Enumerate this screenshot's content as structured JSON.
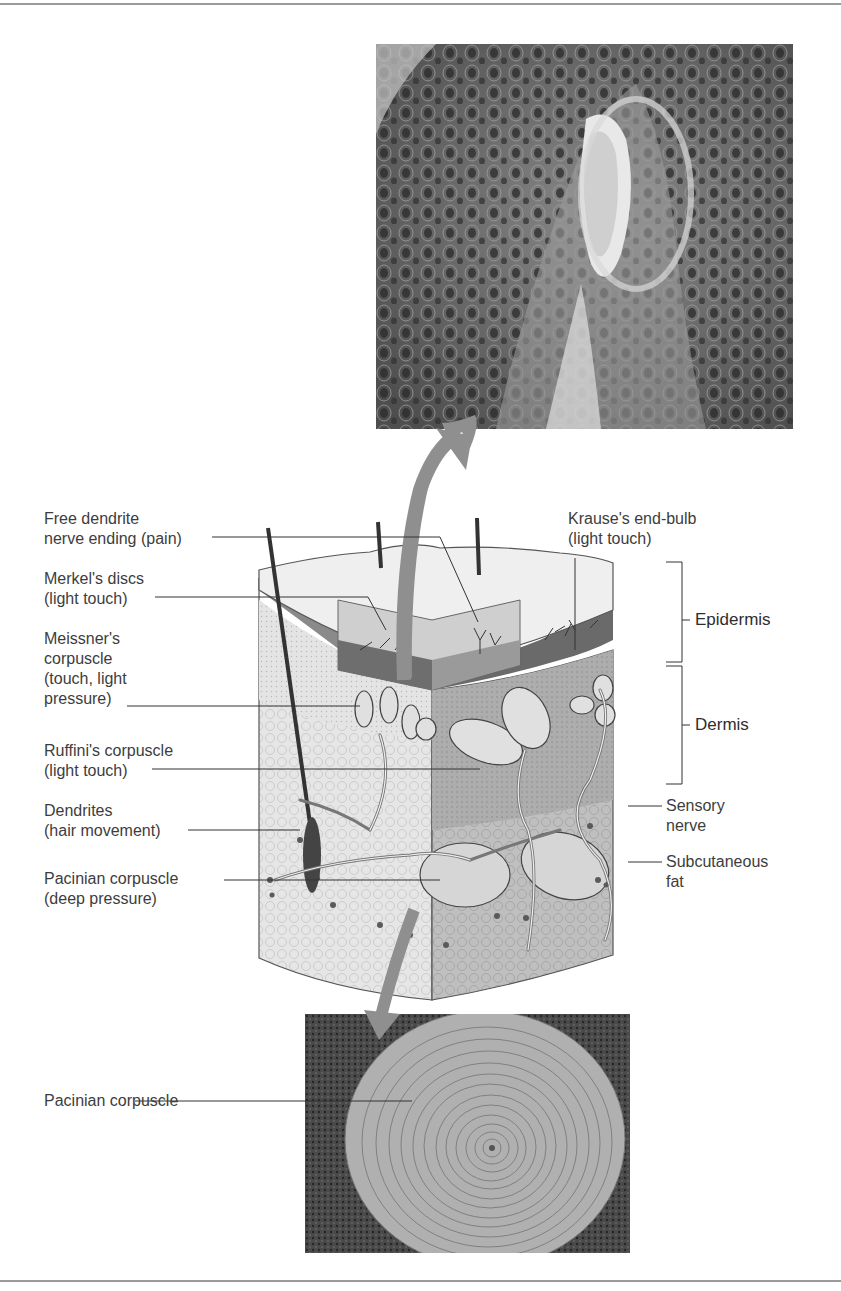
{
  "figure": {
    "micrograph_top": {
      "description": "Light micrograph of Meissner's corpuscle in dermal papilla"
    },
    "micrograph_bottom": {
      "description": "Light micrograph of Pacinian corpuscle cross-section"
    },
    "skin_block": {
      "description": "3D cutaway illustration of skin with sensory receptors"
    }
  },
  "labels_left": [
    {
      "text": "Free dendrite\nnerve ending (pain)"
    },
    {
      "text": "Merkel's discs\n(light touch)"
    },
    {
      "text": "Meissner's\ncorpuscle\n(touch, light\npressure)"
    },
    {
      "text": "Ruffini's corpuscle\n(light touch)"
    },
    {
      "text": "Dendrites\n(hair movement)"
    },
    {
      "text": "Pacinian corpuscle\n(deep pressure)"
    }
  ],
  "labels_right": [
    {
      "text": "Krause's end-bulb\n(light touch)"
    },
    {
      "text": "Epidermis"
    },
    {
      "text": "Dermis"
    },
    {
      "text": "Sensory\nnerve"
    },
    {
      "text": "Subcutaneous\nfat"
    }
  ],
  "label_bottom": {
    "text": "Pacinian corpuscle"
  },
  "colors": {
    "arrow": "#8f8f8f",
    "epidermis_dark": "#6d6d6d",
    "dermis": "#b5b5b5",
    "fat": "#dcdcdc",
    "micrograph_bg": "#5a5a5a"
  }
}
